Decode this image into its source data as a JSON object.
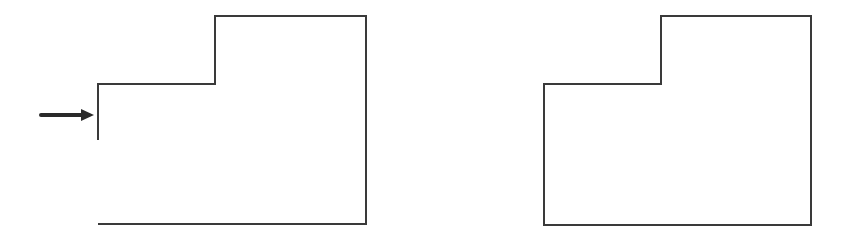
{
  "diagram": {
    "stroke_color": "#3a3a3a",
    "arrow_color": "#2a2a2a",
    "background": "#ffffff",
    "shapes": [
      {
        "id": "open-shape",
        "closed": false,
        "points": [
          [
            98,
            140
          ],
          [
            98,
            84
          ],
          [
            215,
            84
          ],
          [
            215,
            16
          ],
          [
            366,
            16
          ],
          [
            366,
            224
          ],
          [
            98,
            224
          ]
        ],
        "has_arrow": true,
        "arrow": {
          "from": [
            41,
            115
          ],
          "to": [
            94,
            115
          ]
        }
      },
      {
        "id": "closed-shape",
        "closed": true,
        "points": [
          [
            544,
            84
          ],
          [
            661,
            84
          ],
          [
            661,
            16
          ],
          [
            811,
            16
          ],
          [
            811,
            225
          ],
          [
            544,
            225
          ]
        ]
      }
    ]
  }
}
